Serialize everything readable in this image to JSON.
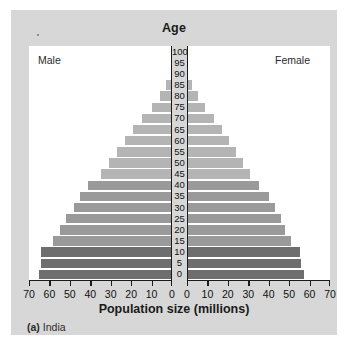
{
  "figure": {
    "title": "Age",
    "xaxis_title": "Population size (millions)",
    "caption_marker": "(a)",
    "caption_text": "India",
    "male_label": "Male",
    "female_label": "Female"
  },
  "colors": {
    "panel_background": "#d7d7d7",
    "plot_background": "#ffffff",
    "axis": "#1b1b1b",
    "bar_young": "#6e6e6e",
    "bar_mid": "#9a9a9a",
    "bar_old": "#b4b4b4",
    "text": "#111111"
  },
  "chart_data": {
    "type": "bar",
    "subtype": "population-pyramid",
    "title": "Age",
    "xlabel": "Population size (millions)",
    "ylabel": "Age",
    "xlim": [
      -70,
      70
    ],
    "xticks_left": [
      70,
      60,
      50,
      40,
      30,
      20,
      10,
      0
    ],
    "xticks_right": [
      0,
      10,
      20,
      30,
      40,
      50,
      60,
      70
    ],
    "xtick_step": 10,
    "yticks": [
      0,
      5,
      10,
      15,
      20,
      25,
      30,
      35,
      40,
      45,
      50,
      55,
      60,
      65,
      70,
      75,
      80,
      85,
      90,
      95,
      100
    ],
    "grid": false,
    "legend_position": "none",
    "categories": [
      "0",
      "5",
      "10",
      "15",
      "20",
      "25",
      "30",
      "35",
      "40",
      "45",
      "50",
      "55",
      "60",
      "65",
      "70",
      "75",
      "80",
      "85",
      "90",
      "95",
      "100"
    ],
    "series": [
      {
        "name": "Male",
        "side": "left",
        "values": [
          65.0,
          64.0,
          64.0,
          58.5,
          55.0,
          52.0,
          48.0,
          45.0,
          41.0,
          35.0,
          31.0,
          27.0,
          23.0,
          19.0,
          14.5,
          10.0,
          6.0,
          3.0,
          0.0,
          0.0,
          0.0
        ]
      },
      {
        "name": "Female",
        "side": "right",
        "values": [
          57.5,
          56.0,
          55.5,
          51.0,
          48.0,
          46.0,
          43.0,
          40.0,
          35.0,
          31.0,
          27.5,
          24.0,
          20.5,
          17.0,
          13.0,
          9.0,
          5.5,
          2.5,
          0.0,
          0.0,
          0.0
        ]
      }
    ],
    "bar_colors_by_category": [
      "#6e6e6e",
      "#6e6e6e",
      "#6e6e6e",
      "#9a9a9a",
      "#9a9a9a",
      "#9a9a9a",
      "#9a9a9a",
      "#9a9a9a",
      "#9a9a9a",
      "#b4b4b4",
      "#b4b4b4",
      "#b4b4b4",
      "#b4b4b4",
      "#b4b4b4",
      "#b4b4b4",
      "#b4b4b4",
      "#b4b4b4",
      "#b4b4b4",
      "#b4b4b4",
      "#b4b4b4",
      "#b4b4b4"
    ]
  }
}
